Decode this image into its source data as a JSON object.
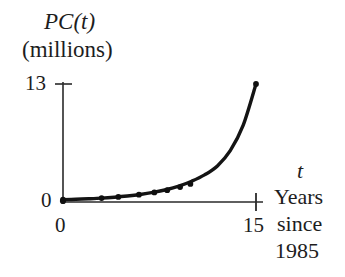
{
  "figure": {
    "background_color": "#ffffff",
    "ink_color": "#1a1a1a"
  },
  "axes": {
    "y_title_function": "PC(t)",
    "y_title_units": "(millions)",
    "y_tick_top": "13",
    "y_tick_origin": "0",
    "x_tick_origin": "0",
    "x_tick_end": "15",
    "x_title_variable": "t",
    "x_title_line1": "Years",
    "x_title_line2": "since",
    "x_title_line3": "1985"
  },
  "chart_data": {
    "type": "line",
    "title": "",
    "xlabel": "t Years since 1985",
    "ylabel": "PC(t) (millions)",
    "xlim": [
      0,
      15
    ],
    "ylim": [
      0,
      13
    ],
    "grid": false,
    "legend": null,
    "xticks": [
      0,
      15
    ],
    "yticks": [
      0,
      13
    ],
    "series": [
      {
        "name": "PC(t)",
        "kind": "curve",
        "style": "solid-thick-exponential",
        "x": [
          0,
          1,
          2,
          3,
          4,
          5,
          6,
          7,
          8,
          9,
          10,
          11,
          12,
          13,
          14,
          15
        ],
        "values": [
          0.15,
          0.19,
          0.25,
          0.32,
          0.42,
          0.55,
          0.72,
          0.95,
          1.25,
          1.65,
          2.2,
          2.9,
          3.9,
          5.6,
          8.4,
          13.0
        ]
      },
      {
        "name": "data points",
        "kind": "markers",
        "marker": "filled-square-dot",
        "x": [
          0,
          3,
          4.3,
          5.9,
          7.1,
          8.1,
          9.1,
          9.9,
          15
        ],
        "values": [
          0.15,
          0.32,
          0.45,
          0.7,
          0.95,
          1.2,
          1.55,
          1.9,
          13.0
        ]
      }
    ]
  }
}
